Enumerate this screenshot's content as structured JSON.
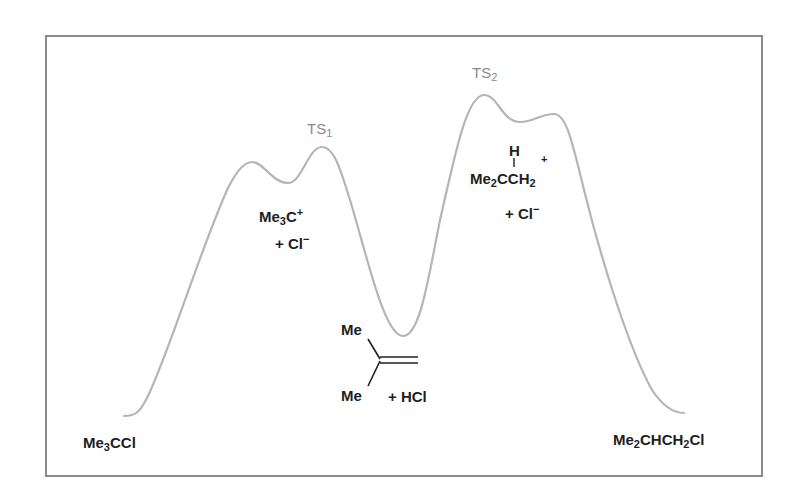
{
  "diagram": {
    "type": "reaction-energy-profile",
    "colors": {
      "curve": "#b5b5b5",
      "frame": "#8c8c8c",
      "ts_label": "#8a8a8a",
      "species_text": "#1e1e1e"
    },
    "transition_states": [
      {
        "label": "TS",
        "subscript": "1"
      },
      {
        "label": "TS",
        "subscript": "2"
      }
    ],
    "species": {
      "reactant": {
        "parts": [
          "Me",
          "3",
          "CCl"
        ],
        "text": "Me3CCl"
      },
      "carbocation1": {
        "line1_parts": [
          "Me",
          "3",
          "C",
          "+"
        ],
        "line2": "+ Cl",
        "line2_charge": "−",
        "text": "Me3C+ + Cl−"
      },
      "alkene": {
        "top_group": "Me",
        "bottom_group": "Me",
        "coproduct": "+ HCl",
        "text": "Me2C=CH2 + HCl"
      },
      "carbocation2": {
        "h_label": "H",
        "charge": "+",
        "line_parts": [
          "Me",
          "2",
          "CCH",
          "2"
        ],
        "line2": "+ Cl",
        "line2_charge": "−",
        "text": "Me2CHCH2+ + Cl−"
      },
      "product": {
        "parts": [
          "Me",
          "2",
          "CHCH",
          "2",
          "Cl"
        ],
        "text": "Me2CHCH2Cl"
      }
    },
    "curve_points": [
      [
        124,
        416
      ],
      [
        251,
        162
      ],
      [
        290,
        183
      ],
      [
        322,
        147
      ],
      [
        403,
        336
      ],
      [
        484,
        95
      ],
      [
        518,
        122
      ],
      [
        556,
        115
      ],
      [
        684,
        413
      ]
    ]
  }
}
